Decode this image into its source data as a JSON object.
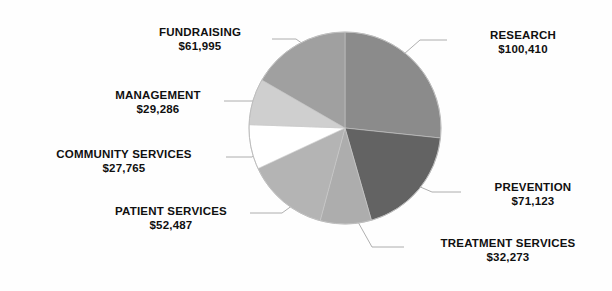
{
  "chart_data": {
    "type": "pie",
    "title": "",
    "subtitle": "",
    "xlabel": "",
    "ylabel": "",
    "legend_position": "none",
    "grid": false,
    "currency_symbol": "$",
    "total": 375339,
    "categories": [
      "RESEARCH",
      "PREVENTION",
      "TREATMENT SERVICES",
      "PATIENT SERVICES",
      "COMMUNITY SERVICES",
      "MANAGEMENT",
      "FUNDRAISING"
    ],
    "values": [
      100410,
      71123,
      32273,
      52487,
      27765,
      29286,
      61995
    ],
    "value_labels": [
      "$100,410",
      "$71,123",
      "$32,273",
      "$52,487",
      "$27,765",
      "$29,286",
      "$61,995"
    ],
    "colors": [
      "#8b8b8b",
      "#636363",
      "#adadad",
      "#b4b4b4",
      "#ffffff",
      "#cfcfcf",
      "#a0a0a0"
    ],
    "slices": [
      {
        "name": "RESEARCH",
        "value": 100410,
        "value_label": "$100,410",
        "start_angle": 0,
        "end_angle": 96,
        "color": "#8b8b8b"
      },
      {
        "name": "PREVENTION",
        "value": 71123,
        "value_label": "$71,123",
        "start_angle": 96,
        "end_angle": 164,
        "color": "#636363"
      },
      {
        "name": "TREATMENT SERVICES",
        "value": 32273,
        "value_label": "$32,273",
        "start_angle": 164,
        "end_angle": 195,
        "color": "#adadad"
      },
      {
        "name": "PATIENT SERVICES",
        "value": 52487,
        "value_label": "$52,487",
        "start_angle": 195,
        "end_angle": 245,
        "color": "#b4b4b4"
      },
      {
        "name": "COMMUNITY SERVICES",
        "value": 27765,
        "value_label": "$27,765",
        "start_angle": 245,
        "end_angle": 272,
        "color": "#ffffff"
      },
      {
        "name": "MANAGEMENT",
        "value": 29286,
        "value_label": "$29,286",
        "start_angle": 272,
        "end_angle": 300,
        "color": "#cfcfcf"
      },
      {
        "name": "FUNDRAISING",
        "value": 61995,
        "value_label": "$61,995",
        "start_angle": 300,
        "end_angle": 360,
        "color": "#a0a0a0"
      }
    ]
  },
  "labels": {
    "research": {
      "name": "RESEARCH",
      "value": "$100,410"
    },
    "prevention": {
      "name": "PREVENTION",
      "value": "$71,123"
    },
    "treatment": {
      "name": "TREATMENT SERVICES",
      "value": "$32,273"
    },
    "patient": {
      "name": "PATIENT SERVICES",
      "value": "$52,487"
    },
    "community": {
      "name": "COMMUNITY SERVICES",
      "value": "$27,765"
    },
    "management": {
      "name": "MANAGEMENT",
      "value": "$29,286"
    },
    "fundraising": {
      "name": "FUNDRAISING",
      "value": "$61,995"
    }
  },
  "geometry": {
    "center_x": 345,
    "center_y": 128,
    "radius": 96
  }
}
